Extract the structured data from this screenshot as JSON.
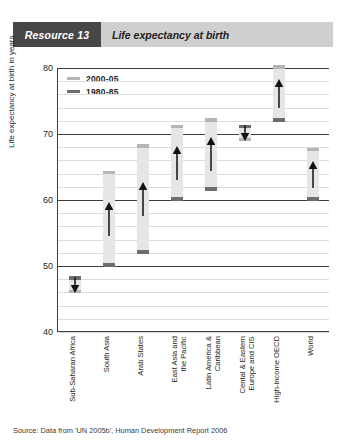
{
  "banner": {
    "tag": "Resource 13",
    "title": "Life expectancy at birth",
    "tag_bg": "#474747",
    "bar_bg": "#cfcfcf"
  },
  "source": "Source: Data from 'UN 2005b', Human Development Report 2006",
  "colors": {
    "old_series": "#6d6d6d",
    "new_series": "#b5b5b5",
    "bar_fill": "#e6e6e6",
    "grid_minor": "#dcdcdc",
    "grid_major": "#3d3d3d"
  },
  "legend": [
    {
      "label": "2000-05",
      "color": "#b5b5b5"
    },
    {
      "label": "1980-85",
      "color": "#6d6d6d"
    }
  ],
  "chart_data": {
    "type": "bar",
    "title": "Life expectancy at birth",
    "xlabel": "",
    "ylabel": "Life expectancy at birth in years",
    "ylim": [
      40,
      80
    ],
    "ytick_labels": [
      "40",
      "50",
      "60",
      "70",
      "80"
    ],
    "ytick_values": [
      40,
      50,
      60,
      70,
      80
    ],
    "grid": true,
    "grid_minor_step": 2,
    "legend_position": "top-left-inside",
    "categories": [
      "Sub-Saharan Africa",
      "South Asia",
      "Arab States",
      "East Asia and\nthe Pacific",
      "Latin America &\nCaribbean",
      "Cental & Eastern\nEurope and CIS",
      "High-income OECD",
      "World"
    ],
    "series": [
      {
        "name": "1980-85",
        "values": [
          48.0,
          50.0,
          52.0,
          60.0,
          61.5,
          71.0,
          72.0,
          60.0
        ]
      },
      {
        "name": "2000-05",
        "values": [
          46.0,
          64.0,
          68.0,
          71.0,
          72.0,
          69.0,
          80.0,
          67.5
        ]
      }
    ],
    "directions": [
      "down",
      "up",
      "up",
      "up",
      "up",
      "down",
      "up",
      "up"
    ]
  }
}
